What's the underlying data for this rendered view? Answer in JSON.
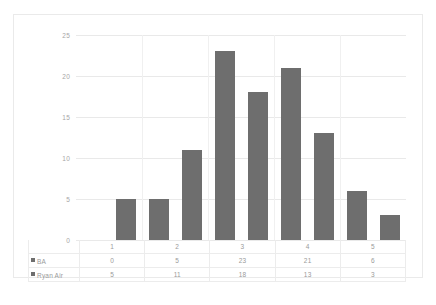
{
  "chart_data": {
    "type": "bar",
    "title": "",
    "subtitle": "",
    "xlabel": "",
    "ylabel": "",
    "categories": [
      "1",
      "2",
      "3",
      "4",
      "5"
    ],
    "series": [
      {
        "name": "BA",
        "values": [
          0,
          5,
          23,
          21,
          6
        ],
        "color": "#6e6e6e"
      },
      {
        "name": "Ryan Air",
        "values": [
          5,
          11,
          18,
          13,
          3
        ],
        "color": "#6e6e6e"
      }
    ],
    "ylim": [
      0,
      25
    ],
    "yticks": [
      "0",
      "5",
      "10",
      "15",
      "20",
      "25"
    ],
    "grid": true,
    "legend": "data-table",
    "data_table_visible": true
  },
  "colors": {
    "bar": "#6e6e6e",
    "gridline": "#e9e9e9",
    "frame_border": "#eaeaea",
    "tick_text": "#a6a6a6",
    "table_border": "#ececec",
    "background": "#ffffff"
  },
  "axis": {
    "ticks": [
      {
        "label": "25",
        "value": 25
      },
      {
        "label": "20",
        "value": 20
      },
      {
        "label": "15",
        "value": 15
      },
      {
        "label": "10",
        "value": 10
      },
      {
        "label": "5",
        "value": 5
      },
      {
        "label": "0",
        "value": 0
      }
    ]
  },
  "table": {
    "category_row": [
      "1",
      "2",
      "3",
      "4",
      "5"
    ],
    "rows": [
      {
        "label": "BA",
        "values": [
          "0",
          "5",
          "23",
          "21",
          "6"
        ]
      },
      {
        "label": "Ryan Air",
        "values": [
          "5",
          "11",
          "18",
          "13",
          "3"
        ]
      }
    ]
  }
}
